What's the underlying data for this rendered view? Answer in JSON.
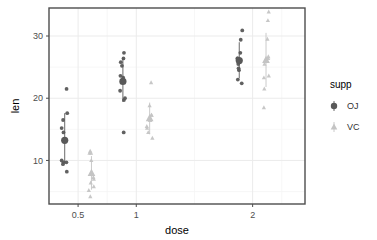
{
  "chart_data": {
    "type": "scatter",
    "title": "",
    "xlabel": "dose",
    "ylabel": "len",
    "x_tick_labels": [
      "0.5",
      "1",
      "2"
    ],
    "x_tick_values": [
      0.5,
      1,
      2
    ],
    "y_tick_labels": [
      "10",
      "20",
      "30"
    ],
    "y_tick_values": [
      10,
      20,
      30
    ],
    "xlim": [
      0.25,
      2.45
    ],
    "ylim": [
      3.0,
      34.5
    ],
    "grid": true,
    "legend_position": "right",
    "legend_title": "supp",
    "series": [
      {
        "name": "OJ",
        "marker": "circle",
        "color": "#595959",
        "points": [
          {
            "dose": 0.5,
            "len": 15.2
          },
          {
            "dose": 0.5,
            "len": 21.5
          },
          {
            "dose": 0.5,
            "len": 17.6
          },
          {
            "dose": 0.5,
            "len": 9.7
          },
          {
            "dose": 0.5,
            "len": 14.5
          },
          {
            "dose": 0.5,
            "len": 10.0
          },
          {
            "dose": 0.5,
            "len": 8.2
          },
          {
            "dose": 0.5,
            "len": 9.4
          },
          {
            "dose": 0.5,
            "len": 16.5
          },
          {
            "dose": 0.5,
            "len": 9.7
          },
          {
            "dose": 1.0,
            "len": 19.7
          },
          {
            "dose": 1.0,
            "len": 23.3
          },
          {
            "dose": 1.0,
            "len": 23.6
          },
          {
            "dose": 1.0,
            "len": 26.4
          },
          {
            "dose": 1.0,
            "len": 20.0
          },
          {
            "dose": 1.0,
            "len": 25.2
          },
          {
            "dose": 1.0,
            "len": 25.8
          },
          {
            "dose": 1.0,
            "len": 21.2
          },
          {
            "dose": 1.0,
            "len": 14.5
          },
          {
            "dose": 1.0,
            "len": 27.3
          },
          {
            "dose": 2.0,
            "len": 25.5
          },
          {
            "dose": 2.0,
            "len": 26.4
          },
          {
            "dose": 2.0,
            "len": 22.4
          },
          {
            "dose": 2.0,
            "len": 24.5
          },
          {
            "dose": 2.0,
            "len": 24.8
          },
          {
            "dose": 2.0,
            "len": 30.9
          },
          {
            "dose": 2.0,
            "len": 26.4
          },
          {
            "dose": 2.0,
            "len": 27.3
          },
          {
            "dose": 2.0,
            "len": 29.4
          },
          {
            "dose": 2.0,
            "len": 23.0
          }
        ],
        "summary": [
          {
            "dose": 0.5,
            "mean": 13.23,
            "sd_low": 9.6,
            "sd_high": 17.6
          },
          {
            "dose": 1.0,
            "mean": 22.7,
            "sd_low": 19.4,
            "sd_high": 26.5
          },
          {
            "dose": 2.0,
            "mean": 26.06,
            "sd_low": 23.2,
            "sd_high": 29.0
          }
        ]
      },
      {
        "name": "VC",
        "marker": "triangle",
        "color": "#c4c4c4",
        "points": [
          {
            "dose": 0.5,
            "len": 4.2
          },
          {
            "dose": 0.5,
            "len": 11.5
          },
          {
            "dose": 0.5,
            "len": 7.3
          },
          {
            "dose": 0.5,
            "len": 5.8
          },
          {
            "dose": 0.5,
            "len": 6.4
          },
          {
            "dose": 0.5,
            "len": 10.0
          },
          {
            "dose": 0.5,
            "len": 11.2
          },
          {
            "dose": 0.5,
            "len": 11.2
          },
          {
            "dose": 0.5,
            "len": 5.2
          },
          {
            "dose": 0.5,
            "len": 7.0
          },
          {
            "dose": 1.0,
            "len": 16.5
          },
          {
            "dose": 1.0,
            "len": 16.5
          },
          {
            "dose": 1.0,
            "len": 15.2
          },
          {
            "dose": 1.0,
            "len": 17.3
          },
          {
            "dose": 1.0,
            "len": 22.5
          },
          {
            "dose": 1.0,
            "len": 17.3
          },
          {
            "dose": 1.0,
            "len": 13.6
          },
          {
            "dose": 1.0,
            "len": 14.5
          },
          {
            "dose": 1.0,
            "len": 18.8
          },
          {
            "dose": 1.0,
            "len": 15.5
          },
          {
            "dose": 2.0,
            "len": 23.6
          },
          {
            "dose": 2.0,
            "len": 18.5
          },
          {
            "dose": 2.0,
            "len": 33.9
          },
          {
            "dose": 2.0,
            "len": 25.5
          },
          {
            "dose": 2.0,
            "len": 26.4
          },
          {
            "dose": 2.0,
            "len": 32.5
          },
          {
            "dose": 2.0,
            "len": 26.7
          },
          {
            "dose": 2.0,
            "len": 21.5
          },
          {
            "dose": 2.0,
            "len": 23.3
          },
          {
            "dose": 2.0,
            "len": 29.5
          }
        ],
        "summary": [
          {
            "dose": 0.5,
            "mean": 7.98,
            "sd_low": 5.3,
            "sd_high": 10.7
          },
          {
            "dose": 1.0,
            "mean": 16.77,
            "sd_low": 14.2,
            "sd_high": 19.3
          },
          {
            "dose": 2.0,
            "mean": 26.14,
            "sd_low": 21.8,
            "sd_high": 30.5
          }
        ]
      }
    ],
    "legend_entries": [
      {
        "label": "OJ",
        "color": "#595959",
        "marker": "circle"
      },
      {
        "label": "VC",
        "color": "#c4c4c4",
        "marker": "triangle"
      }
    ]
  },
  "colors": {
    "panel_border": "#4d4d4d",
    "grid_major": "#ebebeb",
    "grid_minor": "#f5f5f5",
    "background": "#ffffff",
    "oj": "#595959",
    "vc": "#c4c4c4",
    "tick_text": "#4d4d4d",
    "axis_title": "#000000"
  }
}
